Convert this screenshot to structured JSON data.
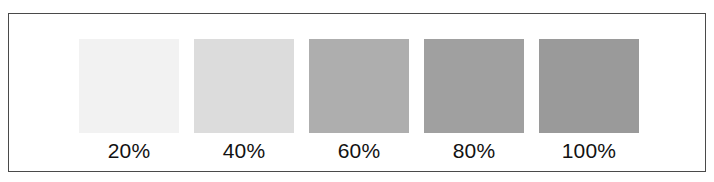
{
  "frame": {
    "border_color": "#4a4a4a",
    "background_color": "#ffffff"
  },
  "chart_data": {
    "type": "bar",
    "title": "",
    "subtitle": "",
    "xlabel": "",
    "ylabel": "",
    "grid": false,
    "legend": "none",
    "categories": [
      "20%",
      "40%",
      "60%",
      "80%",
      "100%"
    ],
    "values": [
      20,
      40,
      60,
      80,
      100
    ],
    "value_unit": "percent",
    "ylim": [
      0,
      100
    ],
    "swatch_colors": [
      "#f2f2f2",
      "#dcdcdc",
      "#aeaeae",
      "#a0a0a0",
      "#9a9a9a"
    ],
    "series": [
      {
        "name": "Screen tint density",
        "values": [
          20,
          40,
          60,
          80,
          100
        ]
      }
    ],
    "annotations": []
  },
  "swatches": [
    {
      "label": "20%",
      "color": "#f2f2f2"
    },
    {
      "label": "40%",
      "color": "#dcdcdc"
    },
    {
      "label": "60%",
      "color": "#aeaeae"
    },
    {
      "label": "80%",
      "color": "#a0a0a0"
    },
    {
      "label": "100%",
      "color": "#9a9a9a"
    }
  ]
}
